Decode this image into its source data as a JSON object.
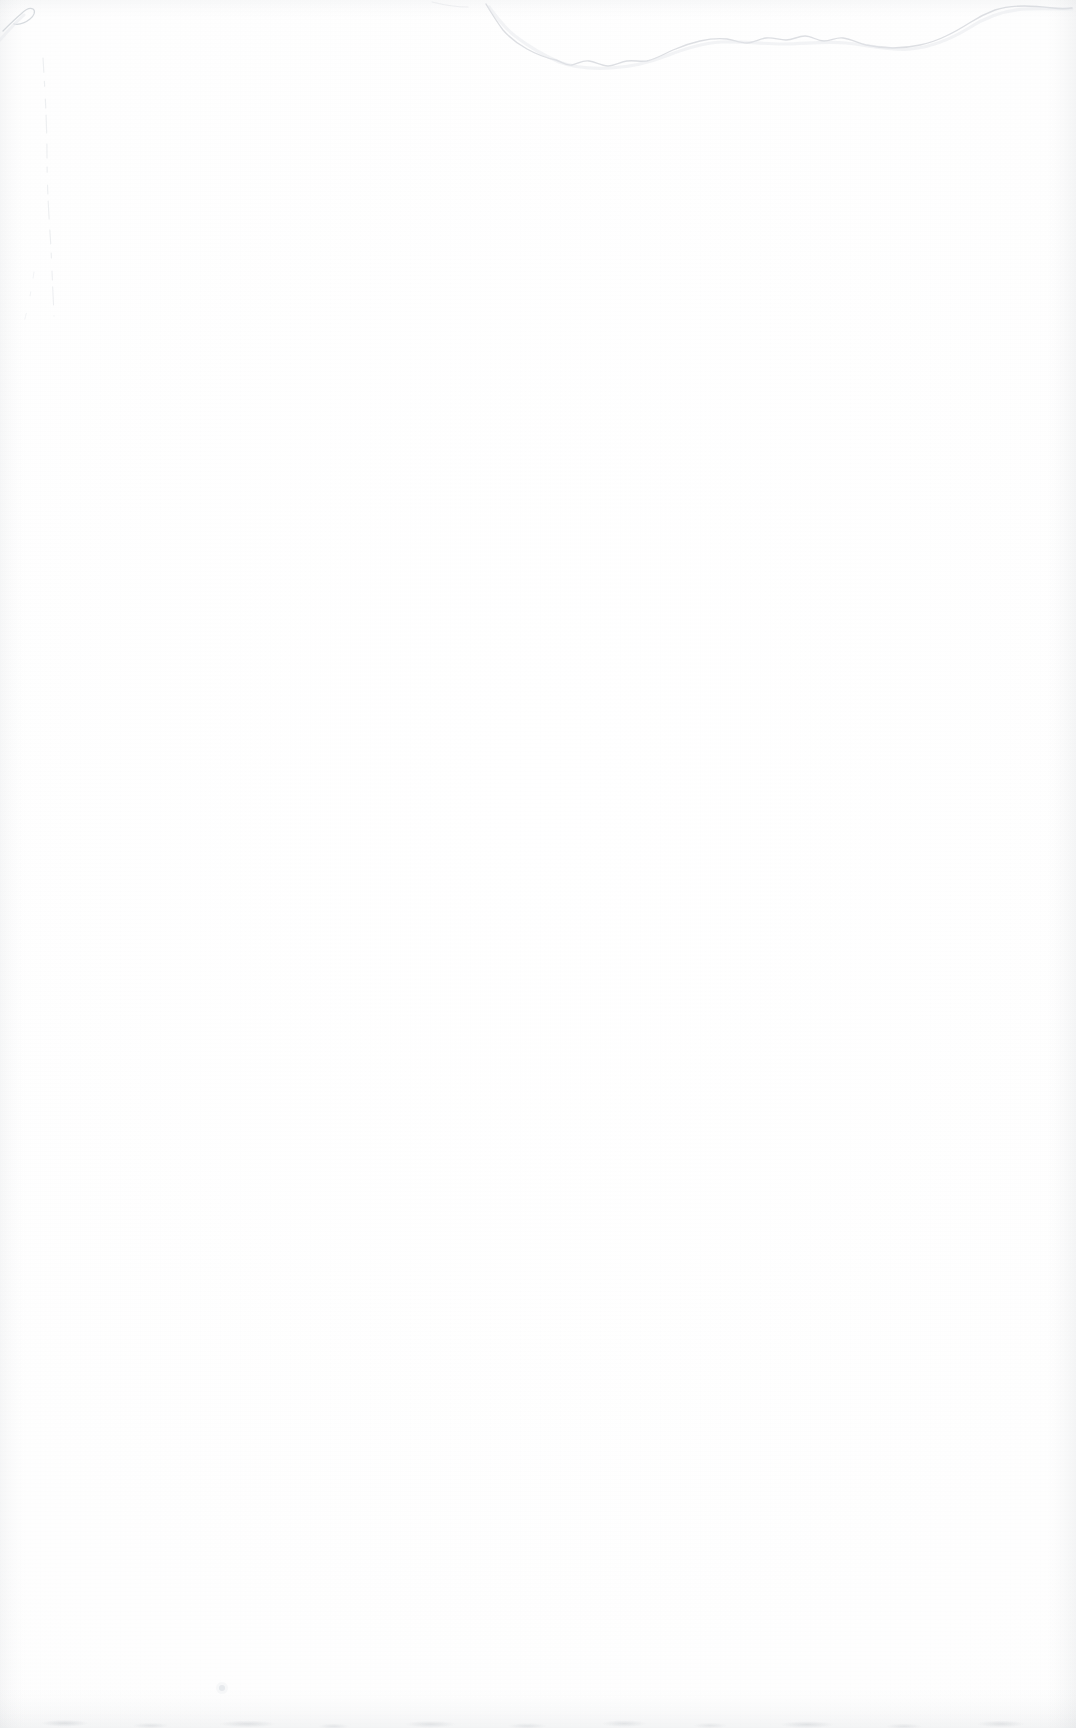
{
  "document": {
    "kind": "scanned-page",
    "title": "Blank scanned page",
    "page_label": "",
    "orientation": "portrait",
    "width_px": 1076,
    "height_px": 1728,
    "has_text": false,
    "has_images": false,
    "text_content": "",
    "notes": "Blank verso/filler leaf of a scanned book. No printed text, figures, page number, header or footer are visible anywhere on the page."
  },
  "colors": {
    "paper_white": "#FEFEFE",
    "paper_highlight": "#FFFFFF",
    "tear_line_dark": "#C8CCD2",
    "tear_line_light": "#E2E5E9",
    "crease_gray": "#DCDFE4",
    "edge_shadow": "#A0A6AE",
    "speck_gray": "#D2D6DB"
  },
  "artifacts": [
    {
      "id": "top-tear-line",
      "name": "top-tear-line",
      "type": "tear-edge",
      "description": "Irregular torn/folded paper edge running across the upper portion of the page. Begins near the top edge at about x=485, dips down to roughly y=62 near x=620, undulates roughly horizontally to the right, then curves upward to meet the right edge near y=10.",
      "start_x": 485,
      "start_y": 4,
      "end_x": 1072,
      "end_y": 8,
      "lowest_y": 66,
      "stroke": "#C8CCD2",
      "opacity": 0.55
    },
    {
      "id": "top-left-corner-fold",
      "name": "corner-fold-mark",
      "type": "fold-crease",
      "description": "Small diagonal hook-shaped fold mark at the extreme top-left corner of the sheet.",
      "x": 6,
      "y": 6,
      "width": 36,
      "height": 26,
      "stroke": "#C3C8CF",
      "opacity": 0.6
    },
    {
      "id": "left-vertical-crease",
      "name": "vertical-crease-line",
      "type": "crease",
      "description": "Faint broken vertical crease near the left margin, running from about y=60 down to about y=320 before fading away entirely.",
      "x": 46,
      "y_start": 58,
      "y_end": 322,
      "stroke": "#DCDFE4",
      "opacity": 0.45
    },
    {
      "id": "dust-speck",
      "name": "dust-speck",
      "type": "speck",
      "description": "Single tiny dust speck in the lower-left quadrant of the page.",
      "x": 222,
      "y": 1688,
      "radius": 3,
      "fill": "#D2D6DB",
      "opacity": 0.5
    },
    {
      "id": "bottom-speckle-band",
      "name": "bottom-speckle-band",
      "type": "scan-edge-noise",
      "description": "Faint mottled speckle band along the very bottom of the scan where the page meets the scanner bed.",
      "y_start": 1694,
      "y_end": 1728,
      "fill": "#9EA4AC",
      "opacity": 0.28
    },
    {
      "id": "edge-shading",
      "name": "scan-edge-shading",
      "type": "gradient-shadow",
      "description": "Soft gray vignette shading along the left, right, top and bottom margins produced by the scanning light falloff.",
      "fill": "#A0A6AE",
      "opacity": 0.11
    }
  ]
}
